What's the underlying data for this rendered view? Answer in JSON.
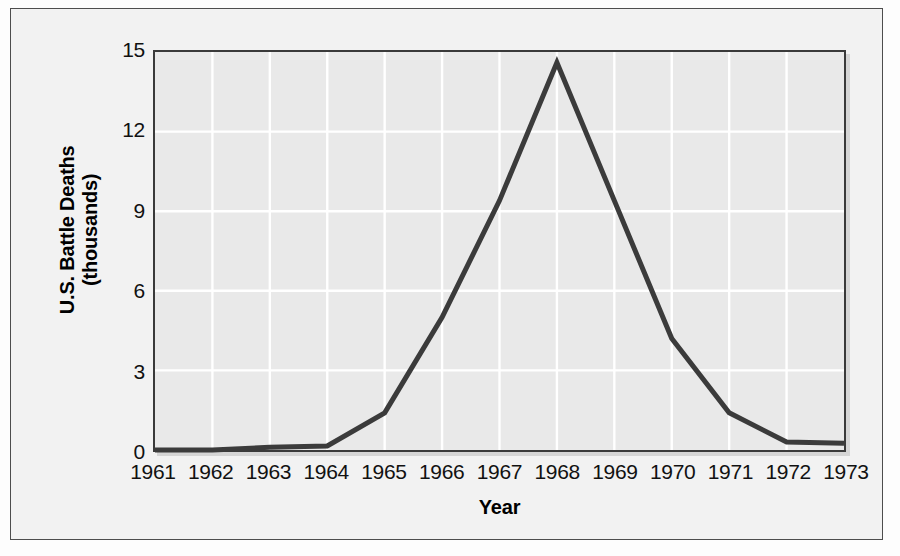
{
  "chart_data": {
    "type": "line",
    "title": "",
    "xlabel": "Year",
    "ylabel_line1": "U.S. Battle Deaths",
    "ylabel_line2": "(thousands)",
    "x": [
      1961,
      1962,
      1963,
      1964,
      1965,
      1966,
      1967,
      1968,
      1969,
      1970,
      1971,
      1972,
      1973
    ],
    "xtick_labels": [
      "1961",
      "1962",
      "1963",
      "1964",
      "1965",
      "1966",
      "1967",
      "1968",
      "1969",
      "1970",
      "1971",
      "1972",
      "1973"
    ],
    "values": [
      0.0,
      0.0,
      0.1,
      0.15,
      1.4,
      5.0,
      9.4,
      14.6,
      9.4,
      4.2,
      1.4,
      0.3,
      0.25
    ],
    "ytick_labels": [
      "15",
      "12",
      "9",
      "6",
      "3",
      "0"
    ],
    "yticks": [
      15,
      12,
      9,
      6,
      3,
      0
    ],
    "ylim": [
      0,
      15
    ],
    "xlim": [
      1961,
      1973
    ],
    "grid": true,
    "grid_color": "#ffffff",
    "legend": "none",
    "series_color": "#3b3b3b",
    "plot_background": "#e9e9e9",
    "figure_background": "#f2f2f2",
    "axis_color": "#3a3a3a",
    "series_name": "U.S. Battle Deaths"
  }
}
